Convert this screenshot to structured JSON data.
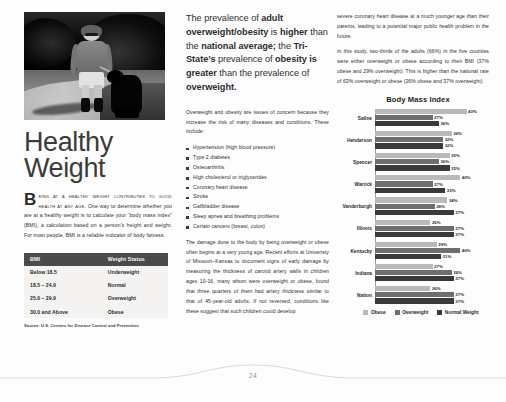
{
  "page": {
    "number": "24",
    "headline": "Healthy Weight"
  },
  "photo": {
    "alt": "woman walking a dog on a trail"
  },
  "left": {
    "lead_dropcap": "B",
    "lead_smallcaps": "eing at a healthy weight contributes to good health at any age.",
    "lead_rest": " One way to determine whether you are at a healthy weight is to calculate your “body mass index” (BMI), a calculation based on a person’s height and weight. For most people, BMI is a reliable indicator of body fatness.",
    "table": {
      "headers": [
        "BMI",
        "Weight Status"
      ],
      "rows": [
        [
          "Below 18.5",
          "Underweight"
        ],
        [
          "18.5 – 24.9",
          "Normal"
        ],
        [
          "25.0 – 29.9",
          "Overweight"
        ],
        [
          "30.0 and Above",
          "Obese"
        ]
      ]
    },
    "source": "Source: U.S. Centers for Disease Control and Prevention"
  },
  "pullquote": {
    "p1": "The prevalence of ",
    "b1": "adult overweight/obesity",
    "p2": " is ",
    "b2": "higher",
    "p3": " than the ",
    "b3": "national average;",
    "p4": " the ",
    "b4": "Tri-State’s",
    "p5": " prevalence of ",
    "b5": "obesity is greater",
    "p6": " than the prevalence of ",
    "b6": "overweight."
  },
  "middle": {
    "intro": "Overweight and obesity are issues of concern because they increase the risk of many diseases and conditions. These include:",
    "bullets": [
      "Hypertension (high blood pressure)",
      "Type 2 diabetes",
      "Osteoarthritis",
      "High cholesterol or triglycerides",
      "Coronary heart disease",
      "Stroke",
      "Gallbladder disease",
      "Sleep apnea and breathing problems",
      "Certain cancers (breast, colon)"
    ],
    "paragraph": "The damage done to the body by being overweight or obese often begins at a very young age. Recent efforts at Univeristy of Missouri–Kansas to document signs of early damage by measuring the thickness of carotid artery walls in children ages 10-16, many whom were overweight or obese, found that three quarters of them had artery thickness similar to that of 45-year-old adults. If not reversed, conditions like these suggest that such children could develop"
  },
  "right": {
    "paragraph1": "severe coronary heart disease at a much younger age than their parents, leading to a potential major public health problem in the future.",
    "paragraph2": "In this study, two-thirds of the adults (66%) in the five counties were either overweight or obese according to their BMI (37% obese and 29% overweight). This is higher than the national rate of 63% overweight or obese (26% obese and 37% overweight)."
  },
  "chart_data": {
    "type": "bar",
    "orientation": "horizontal",
    "title": "Body Mass Index",
    "xlabel": "",
    "ylabel": "",
    "grid": false,
    "legend_position": "bottom",
    "value_suffix": "%",
    "categories": [
      "Saline",
      "Henderson",
      "Spencer",
      "Warrick",
      "Vanderburgh",
      "Illinois",
      "Kentucky",
      "Indiana",
      "Nation"
    ],
    "series": [
      {
        "name": "Obese",
        "color": "#b9b9b9",
        "values": [
          43,
          36,
          35,
          40,
          34,
          26,
          29,
          27,
          26
        ]
      },
      {
        "name": "Overweight",
        "color": "#6e6e6e",
        "values": [
          27,
          32,
          30,
          27,
          28,
          37,
          40,
          36,
          37
        ]
      },
      {
        "name": "Normal Weight",
        "color": "#3a3a3a",
        "values": [
          30,
          32,
          35,
          33,
          37,
          37,
          31,
          37,
          37
        ]
      }
    ],
    "xlim": [
      0,
      46
    ]
  }
}
